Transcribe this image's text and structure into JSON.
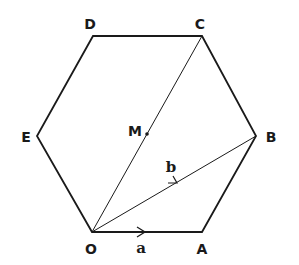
{
  "diagram": {
    "type": "regular-hexagon-vectors",
    "vertices": [
      {
        "id": "O",
        "label": "O",
        "x": 92,
        "y": 232,
        "lx": 91,
        "ly": 254
      },
      {
        "id": "A",
        "label": "A",
        "x": 202,
        "y": 232,
        "lx": 202,
        "ly": 254
      },
      {
        "id": "B",
        "label": "B",
        "x": 256,
        "y": 136,
        "lx": 271,
        "ly": 142
      },
      {
        "id": "C",
        "label": "C",
        "x": 202,
        "y": 36,
        "lx": 200,
        "ly": 29
      },
      {
        "id": "D",
        "label": "D",
        "x": 93,
        "y": 36,
        "lx": 90,
        "ly": 29
      },
      {
        "id": "E",
        "label": "E",
        "x": 37,
        "y": 136,
        "lx": 26,
        "ly": 142
      }
    ],
    "point_M": {
      "label": "M",
      "x": 147,
      "y": 134,
      "lx": 135,
      "ly": 136
    },
    "vectors": [
      {
        "name": "a",
        "label": "a",
        "from": "O",
        "to": "A",
        "lx": 141,
        "ly": 253
      },
      {
        "name": "b",
        "label": "b",
        "from": "O",
        "to": "B",
        "lx": 171,
        "ly": 172
      }
    ],
    "diagonals": [
      {
        "from": "O",
        "to": "C"
      },
      {
        "from": "O",
        "to": "B"
      }
    ],
    "colors": {
      "stroke": "#1a1a1a",
      "background": "#ffffff"
    }
  }
}
